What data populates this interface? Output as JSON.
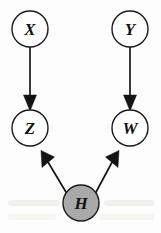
{
  "figure": {
    "name": "causal-dag",
    "width": 161,
    "height": 233,
    "background_color": "#fdfdfd"
  },
  "style": {
    "node_stroke_color": "#1a1a1a",
    "node_open_fill": "#ffffff",
    "node_shaded_fill": "#a9a9a9",
    "edge_color": "#141414",
    "label_color": "#111111",
    "node_radius": 18,
    "shaded_node_radius": 18
  },
  "nodes": [
    {
      "id": "X",
      "label": "X",
      "cx": 30,
      "cy": 29,
      "r": 18,
      "shaded": false,
      "role": "exogenous-treatment"
    },
    {
      "id": "Y",
      "label": "Y",
      "cx": 130,
      "cy": 29,
      "r": 18,
      "shaded": false,
      "role": "exogenous-treatment"
    },
    {
      "id": "Z",
      "label": "Z",
      "cx": 30,
      "cy": 128,
      "r": 18,
      "shaded": false,
      "role": "collider"
    },
    {
      "id": "W",
      "label": "W",
      "cx": 130,
      "cy": 128,
      "r": 18,
      "shaded": false,
      "role": "collider"
    },
    {
      "id": "H",
      "label": "H",
      "cx": 81,
      "cy": 203,
      "r": 18,
      "shaded": true,
      "role": "hidden-confounder"
    }
  ],
  "edges": [
    {
      "id": "X-Z",
      "from": "X",
      "to": "Z",
      "directed": true
    },
    {
      "id": "Y-W",
      "from": "Y",
      "to": "W",
      "directed": true
    },
    {
      "id": "H-Z",
      "from": "H",
      "to": "Z",
      "directed": true
    },
    {
      "id": "H-W",
      "from": "H",
      "to": "W",
      "directed": true
    }
  ],
  "background_artifacts": [
    {
      "id": "smudge-left-lower",
      "x": 8,
      "y": 200,
      "width": 52,
      "height": 7,
      "kind": "faint-bleedthrough-text"
    },
    {
      "id": "smudge-left-bottom",
      "x": 8,
      "y": 215,
      "width": 48,
      "height": 7,
      "kind": "faint-bleedthrough-text"
    },
    {
      "id": "smudge-right-lower",
      "x": 104,
      "y": 200,
      "width": 50,
      "height": 7,
      "kind": "faint-bleedthrough-text"
    },
    {
      "id": "smudge-right-bottom",
      "x": 100,
      "y": 215,
      "width": 54,
      "height": 7,
      "kind": "faint-bleedthrough-text"
    }
  ]
}
